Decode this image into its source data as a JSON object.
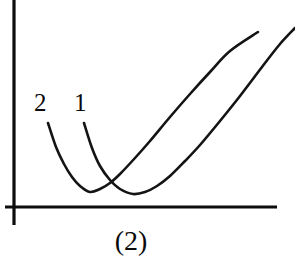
{
  "figure": {
    "caption": "(2)",
    "background_color": "#ffffff",
    "ink_color": "#101010",
    "width": 295,
    "height": 258
  },
  "axes": {
    "origin": {
      "x": 14,
      "y": 207
    },
    "y_axis": {
      "x": 14,
      "y_top": 0,
      "y_bottom": 225,
      "label": ""
    },
    "x_axis": {
      "y": 207,
      "x_left": 5,
      "x_right": 277,
      "label": ""
    },
    "ticks": [],
    "tick_labels": []
  },
  "labels": {
    "curve_2": "2",
    "curve_1": "1"
  },
  "chart_data": {
    "type": "line",
    "title": "(2)",
    "subtitle": "",
    "xlabel": "",
    "ylabel": "",
    "xlim": [
      0,
      295
    ],
    "ylim": [
      0,
      207
    ],
    "grid": false,
    "legend": "inline-labels",
    "annotations": [
      {
        "text": "2",
        "x": 41,
        "y": 103,
        "target_curve": "2"
      },
      {
        "text": "1",
        "x": 80,
        "y": 103,
        "target_curve": "1"
      },
      {
        "text": "(2)",
        "x": 130,
        "y": 242,
        "target_curve": ""
      }
    ],
    "series": [
      {
        "name": "2",
        "label": "2",
        "color": "#141414",
        "minimum": {
          "x": 90,
          "y": 192
        },
        "start_point": {
          "x": 48,
          "y": 123
        },
        "end_point": {
          "x": 258,
          "y": 32
        },
        "points": [
          {
            "x": 48,
            "y": 123
          },
          {
            "x": 56,
            "y": 147
          },
          {
            "x": 64,
            "y": 164
          },
          {
            "x": 72,
            "y": 177
          },
          {
            "x": 80,
            "y": 186
          },
          {
            "x": 90,
            "y": 192
          },
          {
            "x": 100,
            "y": 189
          },
          {
            "x": 110,
            "y": 183
          },
          {
            "x": 120,
            "y": 174
          },
          {
            "x": 135,
            "y": 158
          },
          {
            "x": 150,
            "y": 141
          },
          {
            "x": 170,
            "y": 117
          },
          {
            "x": 190,
            "y": 94
          },
          {
            "x": 210,
            "y": 72
          },
          {
            "x": 230,
            "y": 51
          },
          {
            "x": 258,
            "y": 32
          }
        ]
      },
      {
        "name": "1",
        "label": "1",
        "color": "#141414",
        "minimum": {
          "x": 133,
          "y": 194
        },
        "start_point": {
          "x": 84,
          "y": 123
        },
        "end_point": {
          "x": 295,
          "y": 28
        },
        "points": [
          {
            "x": 84,
            "y": 123
          },
          {
            "x": 92,
            "y": 148
          },
          {
            "x": 100,
            "y": 166
          },
          {
            "x": 110,
            "y": 180
          },
          {
            "x": 120,
            "y": 189
          },
          {
            "x": 133,
            "y": 194
          },
          {
            "x": 145,
            "y": 192
          },
          {
            "x": 157,
            "y": 186
          },
          {
            "x": 170,
            "y": 176
          },
          {
            "x": 185,
            "y": 161
          },
          {
            "x": 200,
            "y": 145
          },
          {
            "x": 220,
            "y": 121
          },
          {
            "x": 240,
            "y": 96
          },
          {
            "x": 262,
            "y": 67
          },
          {
            "x": 280,
            "y": 44
          },
          {
            "x": 295,
            "y": 28
          }
        ]
      }
    ],
    "crossing_point": {
      "x": 110,
      "y": 184
    }
  }
}
